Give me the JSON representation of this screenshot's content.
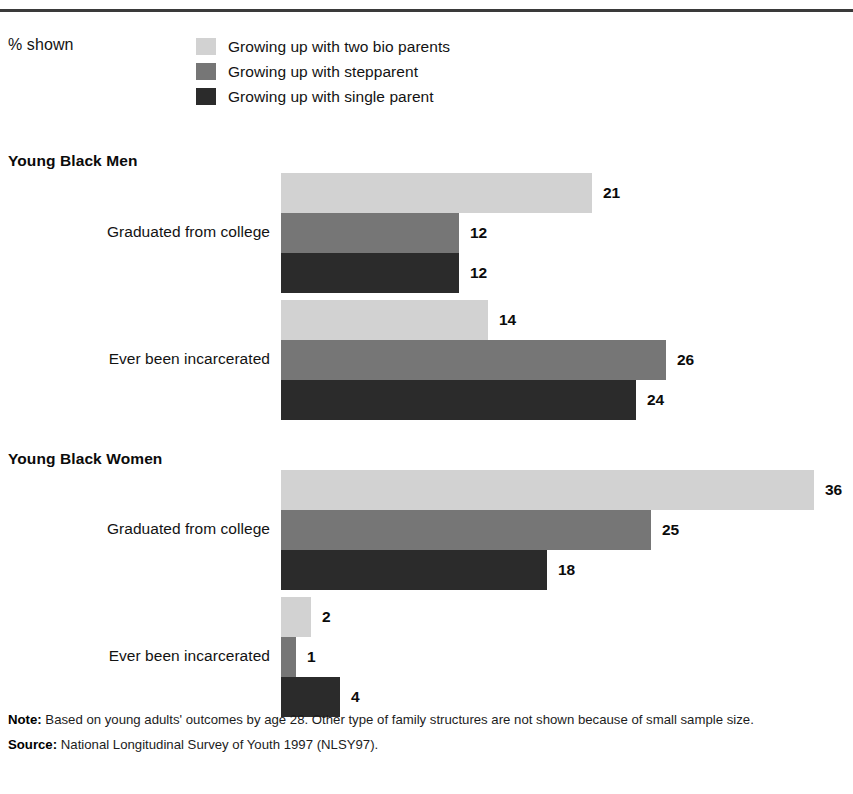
{
  "header": {
    "pct_shown_label": "% shown"
  },
  "legend": {
    "items": [
      {
        "label": "Growing up with two bio parents",
        "color": "#d2d2d2"
      },
      {
        "label": "Growing up with stepparent",
        "color": "#767676"
      },
      {
        "label": "Growing up with single parent",
        "color": "#2b2b2b"
      }
    ]
  },
  "footnotes": {
    "note_label": "Note:",
    "note_text": " Based on young adults' outcomes by age 28. Other type of family structures are not shown because of small sample size.",
    "source_label": "Source:",
    "source_text": " National Longitudinal Survey of Youth 1997 (NLSY97)."
  },
  "chart_data": {
    "type": "bar",
    "orientation": "horizontal",
    "title": "",
    "xlabel": "",
    "ylabel": "",
    "unit": "percent",
    "value_note": "% shown",
    "grid": false,
    "legend_position": "top",
    "xlim": [
      0,
      38
    ],
    "px_per_unit": 14.8,
    "series": [
      {
        "name": "Growing up with two bio parents",
        "color": "#d2d2d2"
      },
      {
        "name": "Growing up with stepparent",
        "color": "#767676"
      },
      {
        "name": "Growing up with single parent",
        "color": "#2b2b2b"
      }
    ],
    "groups": [
      {
        "name": "Young Black Men",
        "categories": [
          {
            "label": "Graduated from college",
            "values": [
              21,
              12,
              12
            ]
          },
          {
            "label": "Ever been incarcerated",
            "values": [
              14,
              26,
              24
            ]
          }
        ]
      },
      {
        "name": "Young Black Women",
        "categories": [
          {
            "label": "Graduated from college",
            "values": [
              36,
              25,
              18
            ]
          },
          {
            "label": "Ever been incarcerated",
            "values": [
              2,
              1,
              4
            ]
          }
        ]
      }
    ]
  }
}
